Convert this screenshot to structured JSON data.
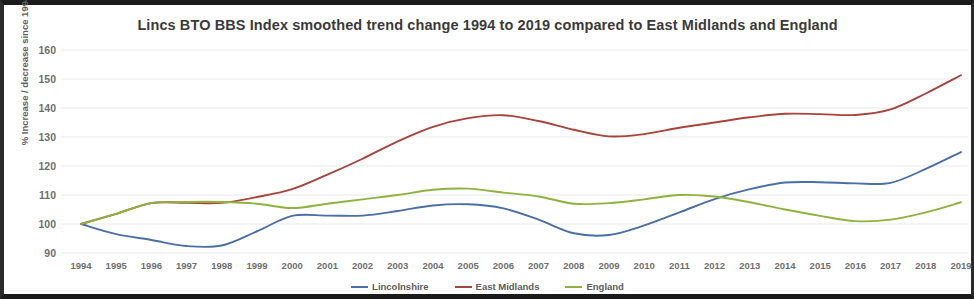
{
  "chart_data": {
    "type": "line",
    "title": "Lincs BTO BBS Index smoothed trend change 1994 to 2019 compared to East Midlands and England",
    "xlabel": "",
    "ylabel": "% Increase / decrease since 1994",
    "ylim": [
      90,
      160
    ],
    "yticks": [
      90,
      100,
      110,
      120,
      130,
      140,
      150,
      160
    ],
    "grid": "horizontal",
    "legend_position": "bottom",
    "categories": [
      "1994",
      "1995",
      "1996",
      "1997",
      "1998",
      "1999",
      "2000",
      "2001",
      "2002",
      "2003",
      "2004",
      "2005",
      "2006",
      "2007",
      "2008",
      "2009",
      "2010",
      "2011",
      "2012",
      "2013",
      "2014",
      "2015",
      "2016",
      "2017",
      "2018",
      "2019"
    ],
    "series": [
      {
        "name": "Lincolnshire",
        "color": "#4a6fa8",
        "values": [
          100,
          96.5,
          94.5,
          92.4,
          92.6,
          97.5,
          102.8,
          102.9,
          102.9,
          104.5,
          106.4,
          106.8,
          105.4,
          101.5,
          96.8,
          96.2,
          99.5,
          104.0,
          108.6,
          112.0,
          114.3,
          114.4,
          114.0,
          114.2,
          119.0,
          124.8
        ]
      },
      {
        "name": "East Midlands",
        "color": "#a8443a",
        "values": [
          100,
          103.5,
          107.2,
          107.3,
          107.3,
          109.3,
          112.0,
          117.0,
          122.5,
          128.5,
          133.5,
          136.5,
          137.5,
          135.5,
          132.5,
          130.2,
          131.0,
          133.2,
          135.0,
          136.8,
          138.0,
          137.9,
          137.6,
          139.5,
          145.0,
          151.3
        ]
      },
      {
        "name": "England",
        "color": "#8fb33e",
        "values": [
          100,
          103.5,
          107.2,
          107.6,
          107.6,
          107.0,
          105.5,
          107.0,
          108.5,
          110.0,
          111.8,
          112.2,
          110.8,
          109.5,
          107.0,
          107.2,
          108.5,
          110.0,
          109.5,
          107.5,
          105.0,
          102.8,
          101.0,
          101.5,
          104.0,
          107.5
        ]
      }
    ]
  },
  "legend": {
    "items": [
      {
        "label": "Lincolnshire",
        "color": "#4a6fa8"
      },
      {
        "label": "East Midlands",
        "color": "#a8443a"
      },
      {
        "label": "England",
        "color": "#8fb33e"
      }
    ]
  }
}
